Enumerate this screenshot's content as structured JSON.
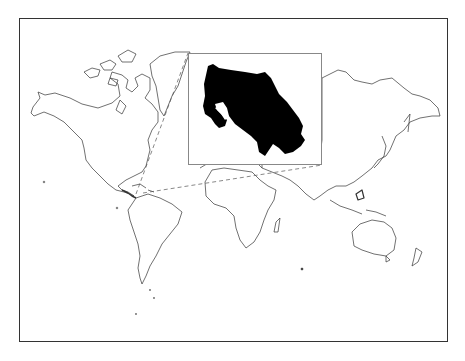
{
  "map": {
    "title": "Locator map: Costa Rica",
    "projection": "world",
    "highlighted_region": "Costa Rica",
    "land_fill": "#ffffff",
    "outline_color": "#333333",
    "highlight_fill": "#000000",
    "frame_color": "#333333",
    "inset_border_color": "#888888",
    "connector_style": "dashed"
  },
  "inset": {
    "label": "Costa Rica (enlarged)"
  }
}
